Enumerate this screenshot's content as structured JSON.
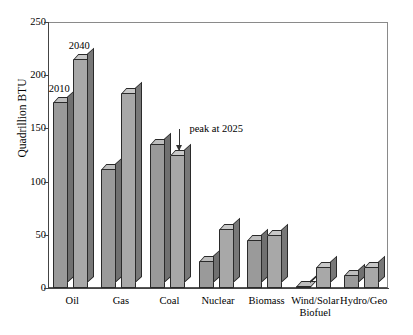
{
  "chart_data": {
    "type": "bar",
    "title": "",
    "xlabel": "",
    "ylabel": "Quadrillion BTU",
    "ylim": [
      0,
      250
    ],
    "yticks": [
      0,
      50,
      100,
      150,
      200,
      250
    ],
    "grid": false,
    "legend_position": "inline-data-labels",
    "categories": [
      "Oil",
      "Gas",
      "Coal",
      "Nuclear",
      "Biomass",
      "Wind/Solar\nBiofuel",
      "Hydro/Geo"
    ],
    "category_labels": [
      {
        "line1": "Oil",
        "line2": ""
      },
      {
        "line1": "Gas",
        "line2": ""
      },
      {
        "line1": "Coal",
        "line2": ""
      },
      {
        "line1": "Nuclear",
        "line2": ""
      },
      {
        "line1": "Biomass",
        "line2": ""
      },
      {
        "line1": "Wind/Solar",
        "line2": "Biofuel"
      },
      {
        "line1": "Hydro/Geo",
        "line2": ""
      }
    ],
    "series": [
      {
        "name": "2010",
        "values": [
          175,
          112,
          135,
          25,
          45,
          2,
          12
        ]
      },
      {
        "name": "2040",
        "values": [
          215,
          183,
          125,
          55,
          50,
          20,
          20
        ]
      }
    ],
    "annotations": [
      {
        "text": "peak at 2025",
        "target_series": "2040",
        "target_category": "Coal"
      }
    ],
    "colors": {
      "series_2010_face": "#9a9a9a",
      "series_2010_top": "#bdbdbd",
      "series_2010_side": "#707070",
      "series_2040_face": "#a8a8a8",
      "series_2040_top": "#c8c8c8",
      "series_2040_side": "#787878",
      "axis": "#444444",
      "frame": "#8a8a8a",
      "text": "#000000"
    }
  }
}
